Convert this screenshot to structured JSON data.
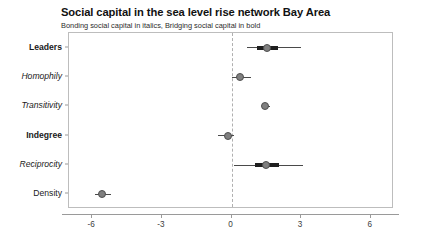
{
  "chart_data": {
    "type": "scatter",
    "title": "Social capital in the sea level rise network Bay Area",
    "subtitle": "Bonding social capital in italics, Bridging social capital in bold",
    "xlabel": "",
    "ylabel": "",
    "xlim": [
      -7.0,
      7.0
    ],
    "xticks": [
      -6,
      -3,
      0,
      3,
      6
    ],
    "xtick_labels": [
      "-6",
      "-3",
      "0",
      "3",
      "6"
    ],
    "grid": false,
    "legend": "none",
    "reference_line": {
      "x": 0,
      "style": "dashed",
      "color": "#b0b0b0"
    },
    "annotations": [
      "Bonding social capital in italics",
      "Bridging social capital in bold"
    ],
    "terms": [
      {
        "label": "Leaders",
        "style": "bold",
        "capital_type": "bridging",
        "estimate": 1.55,
        "inner_low": 1.1,
        "inner_high": 2.0,
        "outer_low": 0.65,
        "outer_high": 3.0
      },
      {
        "label": "Homophily",
        "style": "italic",
        "capital_type": "bonding",
        "estimate": 0.35,
        "inner_low": 0.35,
        "inner_high": 0.35,
        "outer_low": 0.0,
        "outer_high": 0.85
      },
      {
        "label": "Transitivity",
        "style": "italic",
        "capital_type": "bonding",
        "estimate": 1.45,
        "inner_low": 1.45,
        "inner_high": 1.45,
        "outer_low": 1.3,
        "outer_high": 1.65
      },
      {
        "label": "Indegree",
        "style": "bold",
        "capital_type": "bridging",
        "estimate": -0.15,
        "inner_low": -0.15,
        "inner_high": -0.15,
        "outer_low": -0.6,
        "outer_high": 0.1
      },
      {
        "label": "Reciprocity",
        "style": "italic",
        "capital_type": "bonding",
        "estimate": 1.5,
        "inner_low": 1.0,
        "inner_high": 2.05,
        "outer_low": 0.1,
        "outer_high": 3.1
      },
      {
        "label": "Density",
        "style": "plain",
        "capital_type": "control",
        "estimate": -5.6,
        "inner_low": -5.6,
        "inner_high": -5.6,
        "outer_low": -5.9,
        "outer_high": -5.2
      }
    ],
    "colors": {
      "dot_fill": "#808080",
      "dot_stroke": "#4f4f4f",
      "inner_interval": "#1f1f1f",
      "outer_interval": "#4a4a4a",
      "panel_border": "#bdbdbd",
      "axis": "#9a9a9a",
      "background": "#ffffff"
    }
  }
}
